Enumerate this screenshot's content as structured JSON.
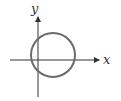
{
  "diagram": {
    "type": "circle-on-axes",
    "axes": {
      "x_label": "x",
      "y_label": "y"
    },
    "circle": {
      "cx": 53,
      "cy": 55,
      "r": 22,
      "stroke": "#6b6b6b"
    },
    "axis_color": "#333333"
  }
}
